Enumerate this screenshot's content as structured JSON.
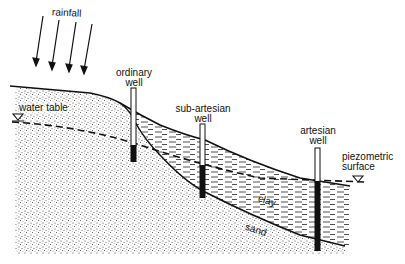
{
  "labels": {
    "rainfall": "rainfall",
    "ordinary_well": [
      "ordinary",
      "well"
    ],
    "sub_artesian_well": [
      "sub-artesian",
      "well"
    ],
    "artesian_well": [
      "artesian",
      "well"
    ],
    "water_table": "water table",
    "piezometric_surface": [
      "piezometric",
      "surface"
    ],
    "clay": "clay",
    "sand": "sand"
  },
  "icons": {
    "water_level_marker": "inverted-triangle"
  },
  "colors": {
    "ink": "#111111",
    "background": "#ffffff",
    "sand_stipple": "#555555"
  }
}
